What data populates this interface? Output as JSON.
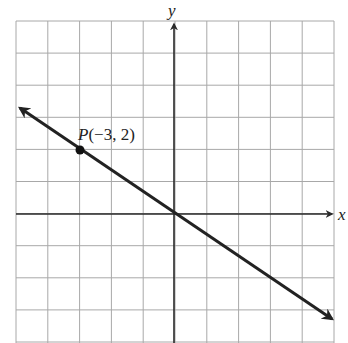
{
  "chart_data": {
    "type": "line",
    "title": "",
    "xlabel": "x",
    "ylabel": "y",
    "xlim": [
      -5,
      5
    ],
    "ylim": [
      -4,
      6
    ],
    "grid": true,
    "series": [
      {
        "name": "line through origin and P",
        "equation": "y = -2/3 x",
        "slope": -0.6667,
        "intercept": 0,
        "x": [
          -4.9,
          5
        ],
        "y": [
          3.27,
          -3.33
        ],
        "arrows": "both ends"
      }
    ],
    "points": [
      {
        "label": "P(−3, 2)",
        "name": "P",
        "x": -3,
        "y": 2
      }
    ]
  },
  "labels": {
    "x_axis": "x",
    "y_axis": "y",
    "point_name": "P",
    "point_coords": "(−3, 2)"
  },
  "colors": {
    "grid": "#a8a8a8",
    "axis": "#2a2a2a",
    "line": "#222222",
    "background": "#ffffff"
  }
}
